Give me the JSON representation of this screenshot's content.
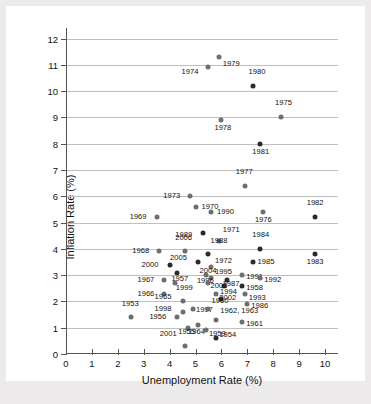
{
  "chart_data": {
    "type": "scatter",
    "title": "",
    "xlabel": "Unemployment Rate (%)",
    "ylabel": "Inflation Rate (%)",
    "xlim": [
      0,
      10.5
    ],
    "ylim": [
      0,
      12.4
    ],
    "xticks": [
      "0",
      "1",
      "2",
      "3",
      "4",
      "5",
      "6",
      "7",
      "8",
      "9",
      "10"
    ],
    "yticks": [
      "0",
      "1",
      "2",
      "3",
      "4",
      "5",
      "6",
      "7",
      "8",
      "9",
      "10",
      "11",
      "12"
    ],
    "grid": "horizontal",
    "legend": "none",
    "marker_colors": {
      "light": "#6e6e6e",
      "dark": "#2b2b2b"
    },
    "points": [
      {
        "label": "1979",
        "x": 5.9,
        "y": 11.3,
        "shade": "light",
        "lx": 4,
        "ly": 7
      },
      {
        "label": "1974",
        "x": 5.5,
        "y": 10.9,
        "shade": "light",
        "lx": -27,
        "ly": 5
      },
      {
        "label": "1980",
        "x": 7.2,
        "y": 10.2,
        "shade": "dark",
        "lx": -4,
        "ly": -14
      },
      {
        "label": "1975",
        "x": 8.3,
        "y": 9.0,
        "shade": "light",
        "lx": -6,
        "ly": -14
      },
      {
        "label": "1978",
        "x": 6.0,
        "y": 8.9,
        "shade": "light",
        "lx": -7,
        "ly": 8
      },
      {
        "label": "1981",
        "x": 7.5,
        "y": 8.0,
        "shade": "dark",
        "lx": -8,
        "ly": 8
      },
      {
        "label": "1977",
        "x": 6.9,
        "y": 6.4,
        "shade": "light",
        "lx": -9,
        "ly": -14
      },
      {
        "label": "1973",
        "x": 4.8,
        "y": 6.0,
        "shade": "light",
        "lx": -27,
        "ly": 0
      },
      {
        "label": "1970",
        "x": 5.0,
        "y": 5.6,
        "shade": "light",
        "lx": 6,
        "ly": 0
      },
      {
        "label": "1990",
        "x": 5.6,
        "y": 5.4,
        "shade": "light",
        "lx": 6,
        "ly": 0
      },
      {
        "label": "1982",
        "x": 9.6,
        "y": 5.2,
        "shade": "dark",
        "lx": -8,
        "ly": -14
      },
      {
        "label": "1976",
        "x": 7.6,
        "y": 5.4,
        "shade": "light",
        "lx": -8,
        "ly": 8
      },
      {
        "label": "1969",
        "x": 3.5,
        "y": 5.2,
        "shade": "light",
        "lx": -27,
        "ly": 0
      },
      {
        "label": "1989",
        "x": 5.3,
        "y": 4.6,
        "shade": "dark",
        "lx": -28,
        "ly": 2
      },
      {
        "label": "1971",
        "x": 5.9,
        "y": 4.3,
        "shade": "light",
        "lx": 4,
        "ly": -11
      },
      {
        "label": "1968",
        "x": 3.6,
        "y": 3.9,
        "shade": "light",
        "lx": -27,
        "ly": 0
      },
      {
        "label": "1984",
        "x": 7.5,
        "y": 4.0,
        "shade": "dark",
        "lx": -8,
        "ly": -14
      },
      {
        "label": "2006",
        "x": 4.6,
        "y": 3.9,
        "shade": "light",
        "lx": -10,
        "ly": -13
      },
      {
        "label": "1988",
        "x": 5.5,
        "y": 3.8,
        "shade": "dark",
        "lx": 2,
        "ly": -13
      },
      {
        "label": "2005",
        "x": 5.1,
        "y": 3.5,
        "shade": "dark",
        "lx": -28,
        "ly": -4
      },
      {
        "label": "1972",
        "x": 5.6,
        "y": 3.3,
        "shade": "light",
        "lx": 4,
        "ly": -6
      },
      {
        "label": "1985",
        "x": 7.2,
        "y": 3.5,
        "shade": "dark",
        "lx": 5,
        "ly": 0
      },
      {
        "label": "2000",
        "x": 4.0,
        "y": 3.4,
        "shade": "dark",
        "lx": -28,
        "ly": 0
      },
      {
        "label": "1995",
        "x": 5.6,
        "y": 2.9,
        "shade": "light",
        "lx": 4,
        "ly": -6
      },
      {
        "label": "1957",
        "x": 4.3,
        "y": 3.1,
        "shade": "dark",
        "lx": -6,
        "ly": 6
      },
      {
        "label": "1996",
        "x": 5.4,
        "y": 3.0,
        "shade": "light",
        "lx": -9,
        "ly": 6
      },
      {
        "label": "1991",
        "x": 6.8,
        "y": 3.0,
        "shade": "light",
        "lx": 4,
        "ly": 2
      },
      {
        "label": "1992",
        "x": 7.5,
        "y": 2.9,
        "shade": "light",
        "lx": 4,
        "ly": 2
      },
      {
        "label": "1967",
        "x": 3.8,
        "y": 2.8,
        "shade": "light",
        "lx": -27,
        "ly": 0
      },
      {
        "label": "1999",
        "x": 4.2,
        "y": 2.7,
        "shade": "light",
        "lx": 1,
        "ly": 5
      },
      {
        "label": "2004",
        "x": 5.5,
        "y": 2.7,
        "shade": "light",
        "lx": -9,
        "ly": -12
      },
      {
        "label": "1987",
        "x": 6.2,
        "y": 2.8,
        "shade": "dark",
        "lx": -4,
        "ly": 4
      },
      {
        "label": "1994",
        "x": 6.1,
        "y": 2.6,
        "shade": "dark",
        "lx": -4,
        "ly": 6
      },
      {
        "label": "1958",
        "x": 6.8,
        "y": 2.6,
        "shade": "dark",
        "lx": 4,
        "ly": 2
      },
      {
        "label": "1983",
        "x": 9.6,
        "y": 3.8,
        "shade": "dark",
        "lx": -8,
        "ly": 8
      },
      {
        "label": "1966",
        "x": 3.8,
        "y": 2.3,
        "shade": "light",
        "lx": -27,
        "ly": 0
      },
      {
        "label": "2002",
        "x": 5.8,
        "y": 2.3,
        "shade": "light",
        "lx": 3,
        "ly": 4
      },
      {
        "label": "1993",
        "x": 6.9,
        "y": 2.3,
        "shade": "light",
        "lx": 4,
        "ly": 4
      },
      {
        "label": "1965",
        "x": 4.5,
        "y": 2.0,
        "shade": "light",
        "lx": -28,
        "ly": -4
      },
      {
        "label": "2003",
        "x": 6.0,
        "y": 2.1,
        "shade": "dark",
        "lx": -11,
        "ly": -13
      },
      {
        "label": "1986",
        "x": 7.0,
        "y": 1.9,
        "shade": "light",
        "lx": 4,
        "ly": 2
      },
      {
        "label": "1998",
        "x": 4.5,
        "y": 1.6,
        "shade": "light",
        "lx": -28,
        "ly": -3
      },
      {
        "label": "1997",
        "x": 4.9,
        "y": 1.7,
        "shade": "light",
        "lx": 3,
        "ly": 1
      },
      {
        "label": "1960",
        "x": 5.5,
        "y": 1.7,
        "shade": "light",
        "lx": 3,
        "ly": -8
      },
      {
        "label": "1953",
        "x": 2.5,
        "y": 1.4,
        "shade": "light",
        "lx": -9,
        "ly": -13
      },
      {
        "label": "1956",
        "x": 4.3,
        "y": 1.4,
        "shade": "light",
        "lx": -28,
        "ly": 0
      },
      {
        "label": "1962, 1963",
        "x": 5.8,
        "y": 1.3,
        "shade": "light",
        "lx": 4,
        "ly": -9
      },
      {
        "label": "1961",
        "x": 6.8,
        "y": 1.2,
        "shade": "light",
        "lx": 4,
        "ly": 2
      },
      {
        "label": "2001",
        "x": 4.7,
        "y": 1.0,
        "shade": "light",
        "lx": -28,
        "ly": 6
      },
      {
        "label": "1964",
        "x": 5.1,
        "y": 1.1,
        "shade": "light",
        "lx": -10,
        "ly": 7
      },
      {
        "label": "1959",
        "x": 5.4,
        "y": 0.9,
        "shade": "light",
        "lx": 3,
        "ly": 4
      },
      {
        "label": "1955",
        "x": 4.6,
        "y": 0.3,
        "shade": "light",
        "lx": -7,
        "ly": -14
      },
      {
        "label": "1954",
        "x": 5.8,
        "y": 0.6,
        "shade": "dark",
        "lx": 3,
        "ly": -3
      }
    ]
  }
}
